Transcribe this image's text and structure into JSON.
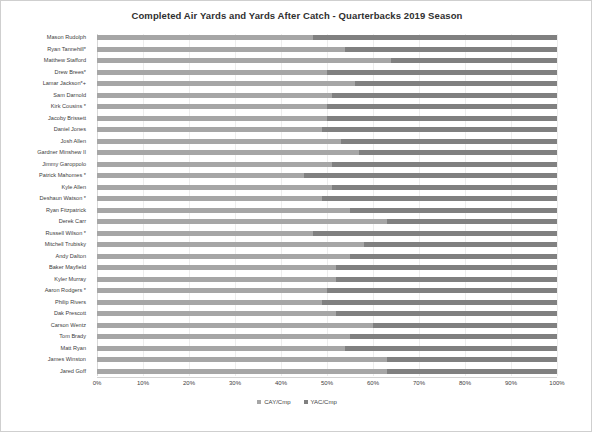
{
  "chart_data": {
    "type": "bar",
    "orientation": "horizontal",
    "stacked": true,
    "normalized": true,
    "title": "Completed Air Yards and Yards After Catch - Quarterbacks 2019 Season",
    "xlabel": "",
    "ylabel": "",
    "xlim": [
      0,
      100
    ],
    "grid": true,
    "legend_position": "bottom",
    "xticks": [
      "0%",
      "10%",
      "20%",
      "30%",
      "40%",
      "50%",
      "60%",
      "70%",
      "80%",
      "90%",
      "100%"
    ],
    "xtick_values": [
      0,
      10,
      20,
      30,
      40,
      50,
      60,
      70,
      80,
      90,
      100
    ],
    "legend": [
      {
        "name": "CAY/Cmp",
        "color": "#a6a6a6"
      },
      {
        "name": "YAC/Cmp",
        "color": "#808080"
      }
    ],
    "categories": [
      "Mason Rudolph",
      "Ryan Tannehill*",
      "Matthew Stafford",
      "Drew Brees*",
      "Lamar Jackson*+",
      "Sam Darnold",
      "Kirk Cousins *",
      "Jacoby Brissett",
      "Daniel Jones",
      "Josh Allen",
      "Gardner Minshew II",
      "Jimmy Garoppolo",
      "Patrick Mahomes *",
      "Kyle Allen",
      "Deshaun Watson *",
      "Ryan Fitzpatrick",
      "Derek Carr",
      "Russell Wilson *",
      "Mitchell Trubisky",
      "Andy Dalton",
      "Baker Mayfield",
      "Kyler Murray",
      "Aaron Rodgers *",
      "Philip Rivers",
      "Dak Prescott",
      "Carson Wentz",
      "Tom Brady",
      "Matt Ryan",
      "James Winston",
      "Jared Goff"
    ],
    "series": [
      {
        "name": "CAY/Cmp",
        "color": "#a6a6a6",
        "values": [
          47,
          54,
          64,
          50,
          56,
          51,
          50,
          50,
          49,
          53,
          57,
          51,
          45,
          51,
          49,
          55,
          63,
          47,
          58,
          55,
          52,
          52,
          50,
          49,
          52,
          60,
          55,
          54,
          63,
          63
        ]
      },
      {
        "name": "YAC/Cmp",
        "color": "#808080",
        "values": [
          53,
          46,
          36,
          50,
          44,
          49,
          50,
          50,
          51,
          47,
          43,
          49,
          55,
          49,
          51,
          45,
          37,
          53,
          42,
          45,
          48,
          48,
          50,
          51,
          48,
          40,
          45,
          46,
          37,
          37
        ]
      }
    ]
  }
}
